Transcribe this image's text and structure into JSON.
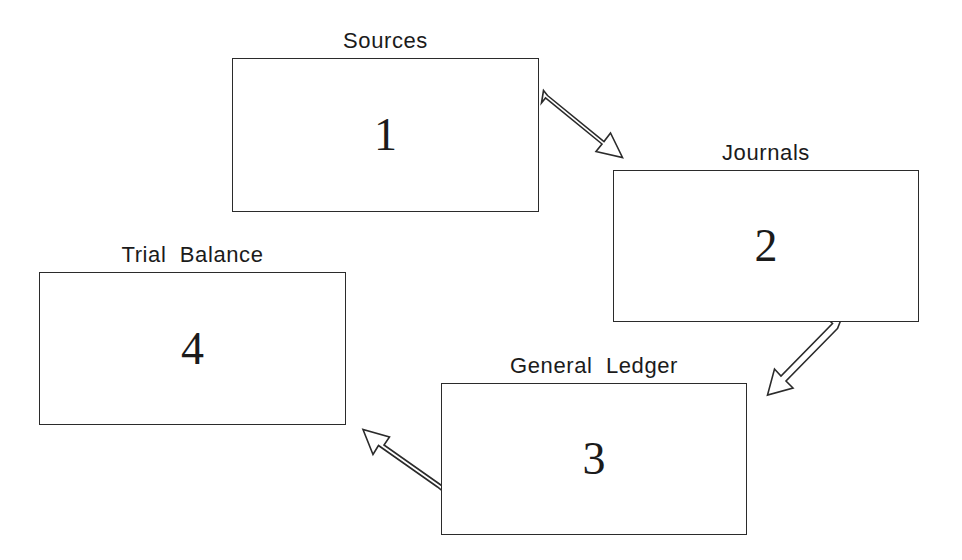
{
  "diagram": {
    "background_color": "#ffffff",
    "line_color": "#2b2b2b",
    "text_color": "#1b1b1b",
    "nodes": [
      {
        "id": "sources",
        "label": "Sources",
        "number": "1",
        "x": 232,
        "y": 58,
        "width": 307,
        "height": 154
      },
      {
        "id": "journals",
        "label": "Journals",
        "number": "2",
        "x": 613,
        "y": 170,
        "width": 306,
        "height": 152
      },
      {
        "id": "general-ledger",
        "label": "General  Ledger",
        "number": "3",
        "x": 441,
        "y": 383,
        "width": 306,
        "height": 152
      },
      {
        "id": "trial-balance",
        "label": "Trial  Balance",
        "number": "4",
        "x": 39,
        "y": 272,
        "width": 307,
        "height": 153
      }
    ],
    "arrows": [
      {
        "id": "sources-to-journals",
        "from": "sources",
        "to": "journals",
        "style": "open-outline",
        "direction": "down-right"
      },
      {
        "id": "journals-to-general-ledger",
        "from": "journals",
        "to": "general-ledger",
        "style": "open-outline",
        "direction": "down-left"
      },
      {
        "id": "general-ledger-to-trial-balance",
        "from": "general-ledger",
        "to": "trial-balance",
        "style": "open-outline",
        "direction": "up-left"
      }
    ]
  }
}
